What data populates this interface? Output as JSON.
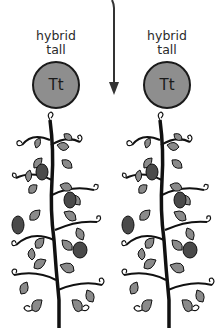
{
  "parents": [
    {
      "label_line1": "hybrid",
      "label_line2": "tall",
      "genotype": "Tt"
    },
    {
      "label_line1": "hybrid",
      "label_line2": "tall",
      "genotype": "Tt"
    }
  ],
  "arrow": {
    "direction": "down"
  },
  "plants": [
    {
      "name": "tall-pea-plant-left"
    },
    {
      "name": "tall-pea-plant-right"
    }
  ],
  "colors": {
    "circle_fill": "#8e8e8e",
    "outline": "#1a1a1a",
    "leaf": "#8a8a8a",
    "pod": "#4a4a4a"
  }
}
